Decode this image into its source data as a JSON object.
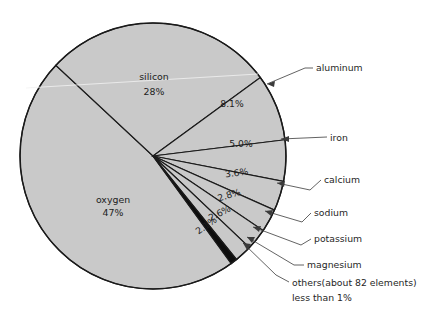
{
  "chart_data": {
    "type": "pie",
    "title": "",
    "subtitle": "",
    "xlabel": "",
    "ylabel": "",
    "legend_position": "callouts-right",
    "grid": false,
    "total_label": "100%",
    "colors": {
      "slice_fill": "#c9c9c9",
      "slice_fill_alt": "#c4c4c4",
      "magnesium_fill": "#0d0d0d",
      "outline": "#1a1a1a",
      "text": "#1c1c1c",
      "leader_line": "#3b3b3b",
      "background": "#ffffff"
    },
    "categories": [
      "oxygen",
      "silicon",
      "aluminum",
      "iron",
      "calcium",
      "sodium",
      "potassium",
      "magnesium",
      "others"
    ],
    "values": [
      47,
      28,
      8.1,
      5.0,
      3.6,
      2.8,
      2.6,
      2.1,
      0.8
    ],
    "slices": [
      {
        "name": "oxygen",
        "value": 47,
        "value_label": "47%",
        "inside_label": "oxygen",
        "label_style": "inside",
        "fill": "#c9c9c9",
        "start_angle": 137.0,
        "end_angle": 306.2
      },
      {
        "name": "silicon",
        "value": 28,
        "value_label": "28%",
        "inside_label": "silicon",
        "label_style": "inside",
        "fill": "#c9c9c9",
        "start_angle": 36.2,
        "end_angle": 137.0
      },
      {
        "name": "aluminum",
        "value": 8.1,
        "value_label": "8.1%",
        "inside_label": "",
        "label_style": "inside-value-callout-name",
        "fill": "#c9c9c9",
        "start_angle": 7.0,
        "end_angle": 36.2
      },
      {
        "name": "iron",
        "value": 5.0,
        "value_label": "5.0%",
        "inside_label": "",
        "label_style": "inside-value-callout-name",
        "fill": "#c9c9c9",
        "start_angle": -11.0,
        "end_angle": 7.0
      },
      {
        "name": "calcium",
        "value": 3.6,
        "value_label": "3.6%",
        "inside_label": "",
        "label_style": "inside-value-callout-name",
        "fill": "#c9c9c9",
        "start_angle": -24.0,
        "end_angle": -11.0
      },
      {
        "name": "sodium",
        "value": 2.8,
        "value_label": "2.8%",
        "inside_label": "",
        "label_style": "inside-value-callout-name",
        "fill": "#c9c9c9",
        "start_angle": -34.1,
        "end_angle": -24.0
      },
      {
        "name": "potassium",
        "value": 2.6,
        "value_label": "2.6%",
        "inside_label": "",
        "label_style": "inside-value-callout-name",
        "fill": "#c9c9c9",
        "start_angle": -43.5,
        "end_angle": -34.1
      },
      {
        "name": "magnesium",
        "value": 2.1,
        "value_label": "2.1%",
        "inside_label": "",
        "label_style": "inside-value-callout-name",
        "fill": "#c9c9c9",
        "start_angle": -51.1,
        "end_angle": -43.5
      },
      {
        "name": "others",
        "value": 0.8,
        "value_label": "",
        "inside_label": "",
        "label_style": "callout-only",
        "fill": "#0d0d0d",
        "start_angle": -54.0,
        "end_angle": -51.1
      }
    ],
    "callouts": [
      {
        "name": "aluminum",
        "label": "aluminum"
      },
      {
        "name": "iron",
        "label": "iron"
      },
      {
        "name": "calcium",
        "label": "calcium"
      },
      {
        "name": "sodium",
        "label": "sodium"
      },
      {
        "name": "potassium",
        "label": "potassium"
      },
      {
        "name": "magnesium",
        "label": "magnesium"
      },
      {
        "name": "others",
        "label": "others(about 82 elements)"
      },
      {
        "name": "others-note",
        "label": "less than 1%"
      }
    ],
    "inside_value_labels": [
      "8.1%",
      "5.0%",
      "3.6%",
      "2.8%",
      "2.6%",
      "2.1%"
    ]
  },
  "pie": {
    "center_x": 153,
    "center_y": 156,
    "radius": 133
  },
  "labels": {
    "oxygen_name": "oxygen",
    "oxygen_value": "47%",
    "silicon_name": "silicon",
    "silicon_value": "28%",
    "aluminum_value": "8.1%",
    "iron_value": "5.0%",
    "calcium_value": "3.6%",
    "sodium_value": "2.8%",
    "potassium_value": "2.6%",
    "magnesium_value": "2.1%",
    "aluminum_name": "aluminum",
    "iron_name": "iron",
    "calcium_name": "calcium",
    "sodium_name": "sodium",
    "potassium_name": "potassium",
    "magnesium_name": "magnesium",
    "others_name": "others(about 82 elements)",
    "others_note": "less than 1%"
  }
}
